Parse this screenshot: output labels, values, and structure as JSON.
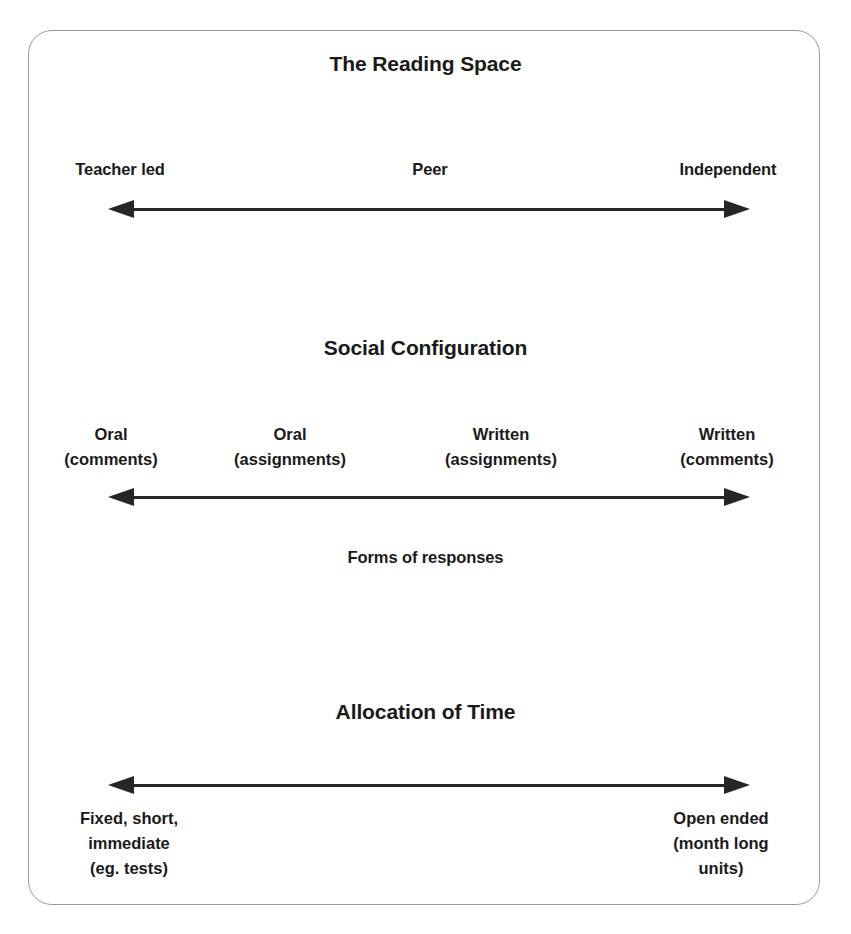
{
  "diagram": {
    "frame": {
      "border_color": "#9a9a9a",
      "background": "#ffffff"
    },
    "arrow_color": "#262626",
    "text_color": "#1a1a1a",
    "sections": [
      {
        "id": "reading-space",
        "title": "The Reading Space",
        "labels": [
          "Teacher led",
          "Peer",
          "Independent"
        ],
        "arrow": "double-headed-horizontal",
        "caption": ""
      },
      {
        "id": "social-configuration",
        "title": "Social Configuration",
        "labels": [
          "Oral\n(comments)",
          "Oral\n(assignments)",
          "Written\n(assignments)",
          "Written\n(comments)"
        ],
        "arrow": "double-headed-horizontal",
        "caption": "Forms of responses"
      },
      {
        "id": "allocation-of-time",
        "title": "Allocation of Time",
        "labels": [
          "Fixed, short,\nimmediate\n(eg. tests)",
          "Open ended\n(month long\nunits)"
        ],
        "arrow": "double-headed-horizontal",
        "caption": ""
      }
    ],
    "titles": {
      "reading_space": "The Reading Space",
      "social_configuration": "Social Configuration",
      "allocation_of_time": "Allocation of Time"
    },
    "row1": {
      "left": "Teacher led",
      "middle": "Peer",
      "right": "Independent"
    },
    "row2": {
      "c1": "Oral\n(comments)",
      "c2": "Oral\n(assignments)",
      "c3": "Written\n(assignments)",
      "c4": "Written\n(comments)",
      "caption": "Forms of responses"
    },
    "row3": {
      "left": "Fixed, short,\nimmediate\n(eg. tests)",
      "right": "Open ended\n(month long\nunits)"
    }
  }
}
